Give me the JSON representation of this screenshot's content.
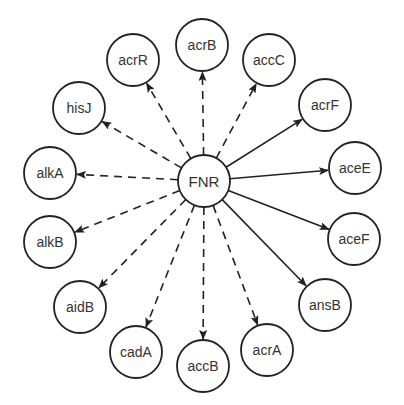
{
  "diagram": {
    "type": "regulatory-network",
    "hub": {
      "id": "FNR",
      "label": "FNR",
      "x": 204,
      "y": 181,
      "r": 26
    },
    "node_radius": 26,
    "colors": {
      "stroke": "#222222",
      "text": "#333333",
      "background": "#ffffff"
    },
    "legend_note": "solid = direct activation, dashed = other regulation (style only)",
    "targets": [
      {
        "id": "acrB",
        "label": "acrB",
        "x": 202,
        "y": 45,
        "edge": "dashed"
      },
      {
        "id": "accC",
        "label": "accC",
        "x": 269,
        "y": 60,
        "edge": "dashed"
      },
      {
        "id": "acrF",
        "label": "acrF",
        "x": 325,
        "y": 105,
        "edge": "solid"
      },
      {
        "id": "aceE",
        "label": "aceE",
        "x": 355,
        "y": 168,
        "edge": "solid"
      },
      {
        "id": "aceF",
        "label": "aceF",
        "x": 354,
        "y": 239,
        "edge": "solid"
      },
      {
        "id": "ansB",
        "label": "ansB",
        "x": 325,
        "y": 305,
        "edge": "solid"
      },
      {
        "id": "acrA",
        "label": "acrA",
        "x": 267,
        "y": 350,
        "edge": "dashed"
      },
      {
        "id": "accB",
        "label": "accB",
        "x": 203,
        "y": 366,
        "edge": "dashed"
      },
      {
        "id": "cadA",
        "label": "cadA",
        "x": 136,
        "y": 352,
        "edge": "dashed"
      },
      {
        "id": "aidB",
        "label": "aidB",
        "x": 80,
        "y": 307,
        "edge": "dashed"
      },
      {
        "id": "alkB",
        "label": "alkB",
        "x": 50,
        "y": 242,
        "edge": "dashed"
      },
      {
        "id": "alkA",
        "label": "alkA",
        "x": 50,
        "y": 173,
        "edge": "dashed"
      },
      {
        "id": "hisJ",
        "label": "hisJ",
        "x": 79,
        "y": 108,
        "edge": "dashed"
      },
      {
        "id": "acrR",
        "label": "acrR",
        "x": 133,
        "y": 60,
        "edge": "dashed"
      }
    ]
  }
}
